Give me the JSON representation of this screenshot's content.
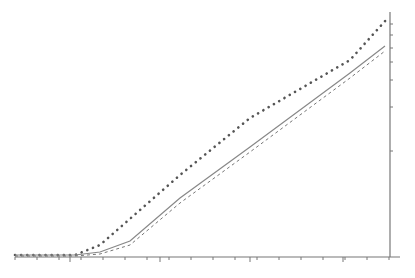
{
  "chart_data": {
    "type": "line",
    "title": "",
    "xlabel": "",
    "ylabel": "",
    "grid": false,
    "legend": null,
    "axes": {
      "x_axis": {
        "pixel_y": 257,
        "pixel_x_start": 15,
        "pixel_x_end": 400,
        "tick_labels": [],
        "minor_tick_px": [
          15,
          37,
          59,
          70,
          81,
          103,
          125,
          147,
          160,
          169,
          191,
          213,
          235,
          250,
          257,
          279,
          301,
          323,
          343,
          345,
          367,
          389
        ]
      },
      "y_axis": {
        "position": "right",
        "pixel_x": 390,
        "pixel_y_top": 12,
        "pixel_y_bottom": 257,
        "tick_labels": [],
        "tick_px": [
          24,
          35,
          48,
          62,
          80,
          107,
          151
        ]
      }
    },
    "series": [
      {
        "name": "dotted",
        "style": "dotted",
        "color": "#555555",
        "points_px": [
          [
            15,
            255
          ],
          [
            75,
            255
          ],
          [
            100,
            245
          ],
          [
            180,
            175
          ],
          [
            250,
            118
          ],
          [
            350,
            60
          ],
          [
            386,
            20
          ]
        ]
      },
      {
        "name": "solid",
        "style": "solid",
        "color": "#888888",
        "points_px": [
          [
            15,
            255
          ],
          [
            75,
            255
          ],
          [
            100,
            252
          ],
          [
            130,
            241
          ],
          [
            180,
            198
          ],
          [
            250,
            147
          ],
          [
            350,
            73
          ],
          [
            385,
            46
          ]
        ]
      },
      {
        "name": "dashed",
        "style": "dashed",
        "color": "#777777",
        "points_px": [
          [
            15,
            256
          ],
          [
            75,
            256
          ],
          [
            100,
            254
          ],
          [
            130,
            245
          ],
          [
            180,
            203
          ],
          [
            250,
            152
          ],
          [
            350,
            78
          ],
          [
            385,
            51
          ]
        ]
      }
    ]
  }
}
